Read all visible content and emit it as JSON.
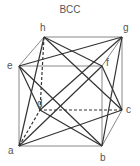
{
  "title": "BCC",
  "colors": {
    "line": "#333333",
    "label": "#555555",
    "background": "#ffffff"
  },
  "vertices": {
    "a": {
      "label": "a",
      "x": 19,
      "y": 146
    },
    "b": {
      "label": "b",
      "x": 102,
      "y": 146
    },
    "c": {
      "label": "c",
      "x": 122,
      "y": 110
    },
    "d": {
      "label": "d",
      "x": 40,
      "y": 110
    },
    "e": {
      "label": "e",
      "x": 19,
      "y": 66
    },
    "f": {
      "label": "f",
      "x": 102,
      "y": 66
    },
    "g": {
      "label": "g",
      "x": 122,
      "y": 37
    },
    "h": {
      "label": "h",
      "x": 44,
      "y": 37
    }
  },
  "edges_solid": [
    [
      "a",
      "b"
    ],
    [
      "b",
      "f"
    ],
    [
      "f",
      "e"
    ],
    [
      "e",
      "a"
    ],
    [
      "h",
      "g"
    ],
    [
      "g",
      "c"
    ],
    [
      "e",
      "h"
    ],
    [
      "f",
      "g"
    ],
    [
      "b",
      "c"
    ]
  ],
  "edges_dashed": [
    [
      "c",
      "d"
    ],
    [
      "d",
      "h"
    ],
    [
      "a",
      "d"
    ]
  ],
  "diagonals": [
    [
      "e",
      "g"
    ],
    [
      "h",
      "f"
    ],
    [
      "a",
      "f"
    ],
    [
      "e",
      "b"
    ],
    [
      "b",
      "g"
    ],
    [
      "f",
      "c"
    ],
    [
      "e",
      "d"
    ],
    [
      "a",
      "h"
    ],
    [
      "a",
      "c"
    ],
    [
      "b",
      "d"
    ],
    [
      "d",
      "g"
    ],
    [
      "h",
      "c"
    ]
  ]
}
